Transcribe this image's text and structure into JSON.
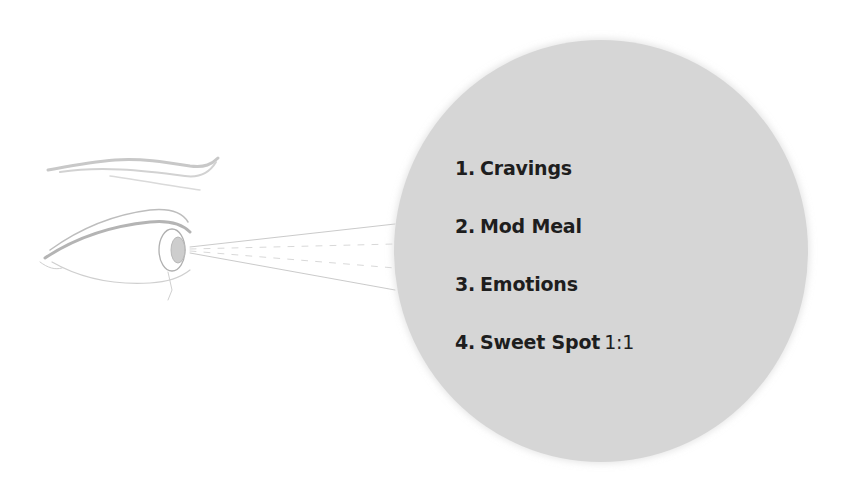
{
  "illustration": {
    "eye_icon": "eye-sketch",
    "projection_lines": "gaze-lines"
  },
  "circle": {
    "fill": "#d6d6d6"
  },
  "items": [
    {
      "number": "1.",
      "label": "Cravings",
      "suffix": ""
    },
    {
      "number": "2.",
      "label": "Mod Meal",
      "suffix": ""
    },
    {
      "number": "3.",
      "label": "Emotions",
      "suffix": ""
    },
    {
      "number": "4.",
      "label": "Sweet Spot",
      "suffix": "1:1"
    }
  ]
}
